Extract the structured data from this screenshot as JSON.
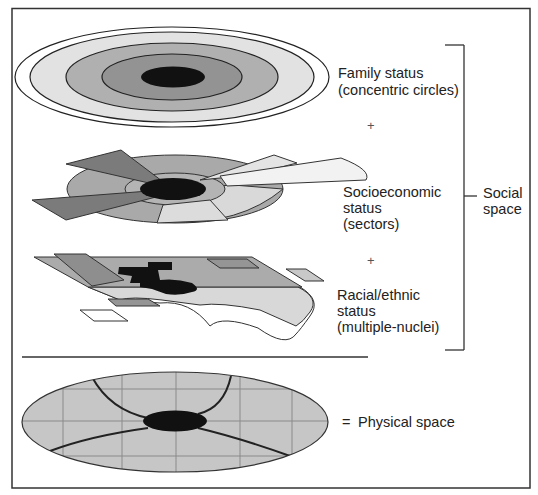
{
  "diagram": {
    "colors": {
      "background": "#ffffff",
      "outline": "#333333",
      "core": "#111111",
      "ring_dark": "#8a8a8a",
      "ring_mid": "#a8a8a8",
      "ring_light": "#cccccc",
      "ring_lightest": "#e6e6e6",
      "sector_dark": "#7a7a7a",
      "sector_light": "#e8e8e8",
      "physical_fill": "#c4c4c4",
      "grid": "#8c8c8c"
    },
    "layers": [
      {
        "id": "family",
        "label_line1": "Family status",
        "label_line2": "(concentric circles)",
        "model": "concentric circles"
      },
      {
        "id": "socioeconomic",
        "label_line1": "Socioeconomic",
        "label_line2": "status",
        "label_line3": "(sectors)",
        "model": "sectors"
      },
      {
        "id": "racial",
        "label_line1": "Racial/ethnic",
        "label_line2": "status",
        "label_line3": "(multiple-nuclei)",
        "model": "multiple-nuclei"
      }
    ],
    "operators": {
      "plus1": "+",
      "plus2": "+",
      "equals": "="
    },
    "bracket_label_line1": "Social",
    "bracket_label_line2": "space",
    "physical_label": "Physical space"
  }
}
